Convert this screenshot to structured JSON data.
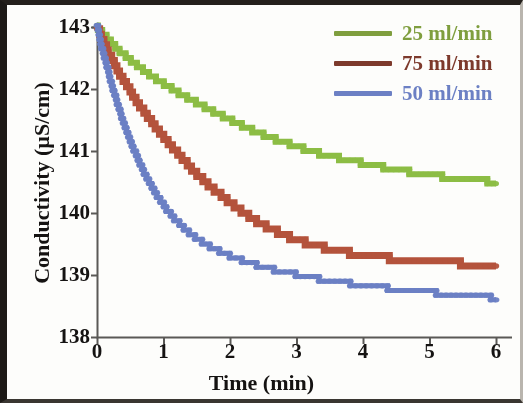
{
  "chart_data": {
    "type": "line",
    "title": "",
    "xlabel": "Time (min)",
    "ylabel": "Conductivity (µS/cm)",
    "xlim": [
      0,
      6.3
    ],
    "ylim": [
      138,
      143.2
    ],
    "xticks": [
      0,
      1,
      2,
      3,
      4,
      5,
      6
    ],
    "xtick_labels": [
      "0",
      "1",
      "2",
      "3",
      "4",
      "5",
      "6"
    ],
    "yticks": [
      138,
      139,
      140,
      141,
      142,
      143
    ],
    "ytick_labels": [
      "138",
      "139",
      "140",
      "141",
      "142",
      "143"
    ],
    "grid": false,
    "legend_position": "top-right",
    "series": [
      {
        "name": "25 ml/min",
        "color": "#8cbd45",
        "x": [
          0.0,
          0.08,
          0.17,
          0.25,
          0.33,
          0.42,
          0.5,
          0.6,
          0.7,
          0.8,
          0.92,
          1.04,
          1.16,
          1.28,
          1.42,
          1.56,
          1.7,
          1.85,
          2.0,
          2.16,
          2.32,
          2.5,
          2.7,
          2.92,
          3.14,
          3.38,
          3.62,
          3.88,
          4.14,
          4.42,
          4.7,
          5.0,
          5.32,
          5.66,
          6.0
        ],
        "y": [
          143.0,
          142.9,
          142.8,
          142.7,
          142.62,
          142.54,
          142.46,
          142.38,
          142.3,
          142.22,
          142.14,
          142.06,
          141.98,
          141.9,
          141.82,
          141.74,
          141.66,
          141.58,
          141.5,
          141.42,
          141.34,
          141.26,
          141.18,
          141.1,
          141.02,
          140.95,
          140.89,
          140.83,
          140.77,
          140.71,
          140.66,
          140.61,
          140.57,
          140.53,
          140.5
        ]
      },
      {
        "name": "75 ml/min",
        "color": "#b4533c",
        "x": [
          0.0,
          0.06,
          0.12,
          0.18,
          0.25,
          0.32,
          0.4,
          0.48,
          0.56,
          0.65,
          0.74,
          0.84,
          0.94,
          1.05,
          1.16,
          1.28,
          1.4,
          1.53,
          1.66,
          1.8,
          1.95,
          2.1,
          2.26,
          2.42,
          2.6,
          2.78,
          2.97,
          3.17,
          3.38,
          3.6,
          3.83,
          4.07,
          4.32,
          4.58,
          4.85,
          5.13,
          5.42,
          5.72,
          6.0
        ],
        "y": [
          143.0,
          142.84,
          142.7,
          142.56,
          142.42,
          142.28,
          142.14,
          142.0,
          141.86,
          141.72,
          141.58,
          141.44,
          141.3,
          141.16,
          141.02,
          140.88,
          140.74,
          140.6,
          140.47,
          140.34,
          140.21,
          140.08,
          139.96,
          139.85,
          139.75,
          139.66,
          139.58,
          139.51,
          139.45,
          139.4,
          139.35,
          139.31,
          139.28,
          139.25,
          139.23,
          139.21,
          139.19,
          139.17,
          139.16
        ]
      },
      {
        "name": "50 ml/min",
        "color": "#6c80c4",
        "x": [
          0.0,
          0.05,
          0.11,
          0.17,
          0.23,
          0.3,
          0.37,
          0.45,
          0.53,
          0.62,
          0.71,
          0.81,
          0.92,
          1.03,
          1.15,
          1.28,
          1.42,
          1.57,
          1.73,
          1.9,
          2.08,
          2.27,
          2.47,
          2.68,
          2.9,
          3.13,
          3.37,
          3.62,
          3.88,
          4.15,
          4.43,
          4.72,
          5.02,
          5.33,
          5.65,
          6.0
        ],
        "y": [
          143.0,
          142.74,
          142.5,
          142.26,
          142.02,
          141.78,
          141.54,
          141.3,
          141.07,
          140.85,
          140.64,
          140.44,
          140.25,
          140.08,
          139.92,
          139.78,
          139.65,
          139.54,
          139.44,
          139.35,
          139.27,
          139.2,
          139.14,
          139.08,
          139.03,
          138.98,
          138.93,
          138.89,
          138.85,
          138.81,
          138.78,
          138.75,
          138.72,
          138.69,
          138.66,
          138.63
        ]
      }
    ]
  },
  "axes": {
    "x_title": "Time (min)",
    "y_title": "Conductivity (µS/cm)",
    "axis_color": "#5a5956"
  },
  "legend": {
    "entries": [
      {
        "label": "25 ml/min",
        "color": "#7f9e3e"
      },
      {
        "label": "75 ml/min",
        "color": "#7d3a2c"
      },
      {
        "label": "50 ml/min",
        "color": "#6c80c4"
      }
    ]
  }
}
